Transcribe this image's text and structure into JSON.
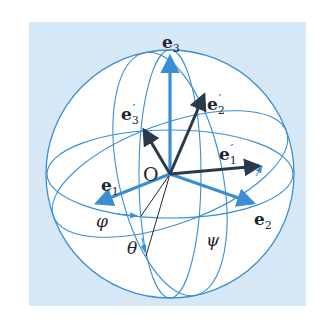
{
  "diagram": {
    "colors": {
      "background_panel": "#d6e7f6",
      "sphere_fill": "#ffffff",
      "sphere_lines": "#3a8fd4",
      "original_axes": "#3a8fd4",
      "rotated_axes": "#2a3a4a",
      "construction_lines": "#1f2630"
    },
    "labels": {
      "origin": "O",
      "e1": {
        "base": "e",
        "sub": "1",
        "prime": ""
      },
      "e2": {
        "base": "e",
        "sub": "2",
        "prime": ""
      },
      "e3": {
        "base": "e",
        "sub": "3",
        "prime": ""
      },
      "e1p": {
        "base": "e",
        "sub": "1",
        "prime": "′"
      },
      "e2p": {
        "base": "e",
        "sub": "2",
        "prime": "′"
      },
      "e3p": {
        "base": "e",
        "sub": "3",
        "prime": "′"
      },
      "phi": "φ",
      "theta": "θ",
      "psi": "ψ"
    }
  }
}
